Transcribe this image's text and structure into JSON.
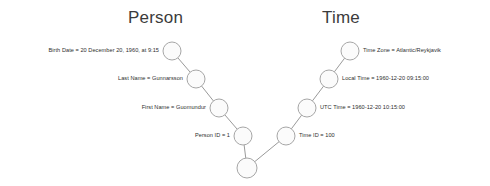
{
  "headings": {
    "left": "Person",
    "right": "Time"
  },
  "colors": {
    "node_fill": "#fbfbfb",
    "node_stroke": "#a6a6a6",
    "edge_stroke": "#9a9a9a",
    "heading_text": "#3b3b3b",
    "label_text": "#2e2e2e",
    "background": "#ffffff"
  },
  "left_branch": {
    "nodes": [
      {
        "label": "Birth Date = 20 December 20, 1960, at 9:15",
        "cx": 172,
        "cy": 51,
        "r": 9
      },
      {
        "label": "Last Name = Gunnarsson",
        "cx": 196,
        "cy": 79,
        "r": 9
      },
      {
        "label": "First Name = Guomundur",
        "cx": 219,
        "cy": 108,
        "r": 9
      },
      {
        "label": "Person ID = 1",
        "cx": 243,
        "cy": 136,
        "r": 9
      }
    ]
  },
  "right_branch": {
    "nodes": [
      {
        "label": "Time Zone = Atlantic/Reykjavik",
        "cx": 350,
        "cy": 51,
        "r": 9
      },
      {
        "label": "Local Time = 1960-12-20 09:15:00",
        "cx": 329,
        "cy": 79,
        "r": 9
      },
      {
        "label": "UTC Time = 1960-12-20 10:15:00",
        "cx": 307,
        "cy": 108,
        "r": 9
      },
      {
        "label": "Time ID = 100",
        "cx": 286,
        "cy": 136,
        "r": 9
      }
    ]
  },
  "root_node": {
    "label": "",
    "cx": 247,
    "cy": 168,
    "r": 10
  }
}
